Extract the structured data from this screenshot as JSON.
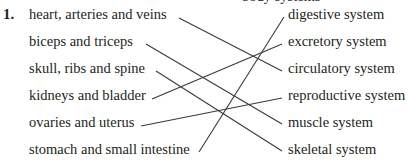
{
  "exercise": {
    "number": "1.",
    "cut_off_text": "body systems",
    "left_items": [
      {
        "label": "heart, arteries and veins"
      },
      {
        "label": "biceps and triceps"
      },
      {
        "label": "skull, ribs and spine"
      },
      {
        "label": "kidneys and bladder"
      },
      {
        "label": "ovaries and uterus"
      },
      {
        "label": "stomach and small intestine"
      }
    ],
    "right_items": [
      {
        "label": "digestive system"
      },
      {
        "label": "excretory system"
      },
      {
        "label": "circulatory system"
      },
      {
        "label": "reproductive system"
      },
      {
        "label": "muscle system"
      },
      {
        "label": "skeletal system"
      }
    ],
    "matches": [
      {
        "left": "heart, arteries and veins",
        "right": "circulatory system"
      },
      {
        "left": "biceps and triceps",
        "right": "muscle system"
      },
      {
        "left": "skull, ribs and spine",
        "right": "skeletal system"
      },
      {
        "left": "kidneys and bladder",
        "right": "excretory system"
      },
      {
        "left": "ovaries and uterus",
        "right": "reproductive system"
      },
      {
        "left": "stomach and small intestine",
        "right": "digestive system"
      }
    ]
  }
}
